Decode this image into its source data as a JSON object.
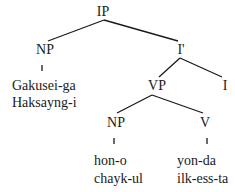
{
  "tree": {
    "root": {
      "label": "IP"
    },
    "subject_np": {
      "label": "NP",
      "words": [
        "Gakusei-ga",
        "Haksayng-i"
      ]
    },
    "i_bar": {
      "label": "I'"
    },
    "vp": {
      "label": "VP"
    },
    "infl": {
      "label": "I"
    },
    "object_np": {
      "label": "NP",
      "words": [
        "hon-o",
        "chayk-ul"
      ]
    },
    "verb": {
      "label": "V",
      "words": [
        "yon-da",
        "ilk-ess-ta"
      ]
    }
  }
}
